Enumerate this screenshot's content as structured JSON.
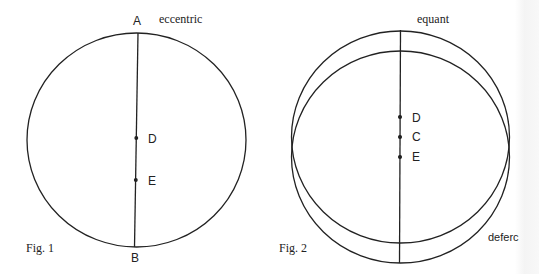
{
  "figure1": {
    "caption": "Fig. 1",
    "circle_label": "eccentric",
    "top_point": "A",
    "bottom_point": "B",
    "points": [
      "D",
      "E"
    ]
  },
  "figure2": {
    "caption": "Fig. 2",
    "upper_circle_label": "equant",
    "lower_circle_label": "deferc",
    "points": [
      "D",
      "C",
      "E"
    ]
  },
  "colors": {
    "stroke": "#222222",
    "background": "#ffffff"
  }
}
